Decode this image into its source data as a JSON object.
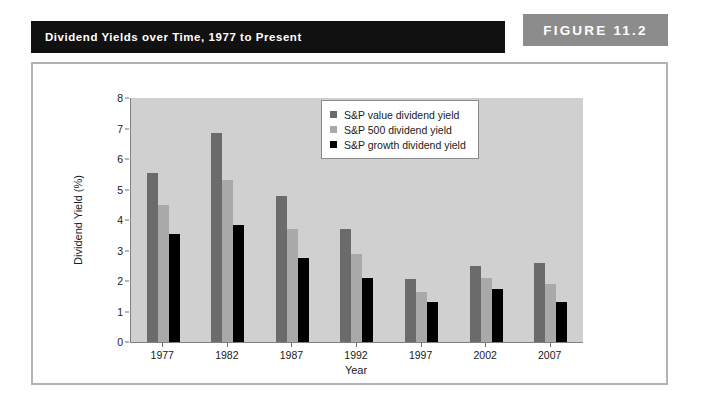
{
  "header": {
    "caption": "Dividend Yields over Time, 1977 to Present",
    "figure_tag": "FIGURE 11.2",
    "caption_bar_color": "#111111",
    "tag_bar_color": "#8c8c8c"
  },
  "chart_data": {
    "type": "bar",
    "title": "Dividend Yields over Time, 1977 to Present",
    "xlabel": "Year",
    "ylabel": "Dividend Yield (%)",
    "categories": [
      "1977",
      "1982",
      "1987",
      "1992",
      "1997",
      "2002",
      "2007"
    ],
    "ylim": [
      0,
      8
    ],
    "yticks": [
      0,
      1,
      2,
      3,
      4,
      5,
      6,
      7,
      8
    ],
    "grid": false,
    "legend_position": "top-right",
    "plot_background": "#d0d0d0",
    "series": [
      {
        "name": "S&P value dividend yield",
        "color": "#6b6b6b",
        "values": [
          5.55,
          6.85,
          4.8,
          3.7,
          2.05,
          2.5,
          2.6
        ]
      },
      {
        "name": "S&P 500 dividend yield",
        "color": "#a9a9a9",
        "values": [
          4.5,
          5.3,
          3.7,
          2.9,
          1.65,
          2.1,
          1.9
        ]
      },
      {
        "name": "S&P growth dividend yield",
        "color": "#000000",
        "values": [
          3.55,
          3.85,
          2.75,
          2.1,
          1.3,
          1.75,
          1.3
        ]
      }
    ]
  }
}
